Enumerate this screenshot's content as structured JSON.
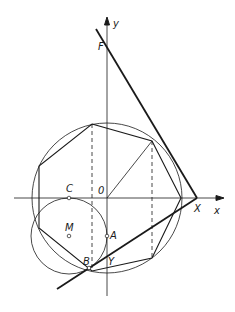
{
  "diagram": {
    "axes": {
      "x_label": "x",
      "y_label": "y"
    },
    "points": {
      "origin": "0",
      "F": "F",
      "C": "C",
      "M": "M",
      "A": "A",
      "B": "B",
      "Y": "Y",
      "X": "X"
    },
    "colors": {
      "line": "#1a1a1a",
      "background": "#ffffff"
    }
  }
}
